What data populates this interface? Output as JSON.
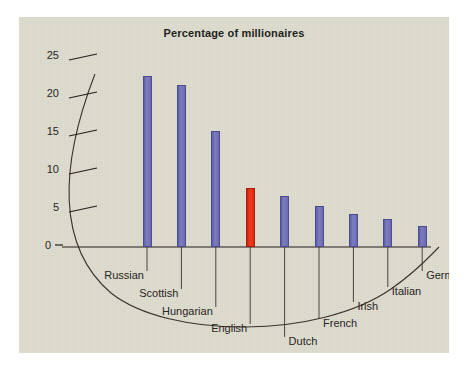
{
  "figure": {
    "panel_bg": "#dcdbcd",
    "outer_bg": "#ffffff"
  },
  "chart_data": {
    "type": "bar",
    "title": "Percentage of millionaires",
    "xlabel": "",
    "ylabel": "",
    "categories": [
      "Russian",
      "Scottish",
      "Hungarian",
      "English",
      "Dutch",
      "French",
      "Irish",
      "Italian",
      "German"
    ],
    "values": [
      22.5,
      21.3,
      15.2,
      7.8,
      6.7,
      5.4,
      4.4,
      3.7,
      2.8
    ],
    "ylim": [
      0,
      27
    ],
    "yticks": [
      0,
      5,
      10,
      15,
      20,
      25
    ],
    "ytick_labels": [
      "0",
      "5",
      "10",
      "15",
      "20",
      "25"
    ],
    "grid": false,
    "legend": "none",
    "bar_color": "#6f6fb4",
    "highlight_color": "#e22a14",
    "highlight_category": "English",
    "axis_color": "#241f1c"
  },
  "axis": {
    "ticks": [
      {
        "label": "25",
        "value": 25
      },
      {
        "label": "20",
        "value": 20
      },
      {
        "label": "15",
        "value": 15
      },
      {
        "label": "10",
        "value": 10
      },
      {
        "label": "5",
        "value": 5
      },
      {
        "label": "0",
        "value": 0
      }
    ]
  }
}
